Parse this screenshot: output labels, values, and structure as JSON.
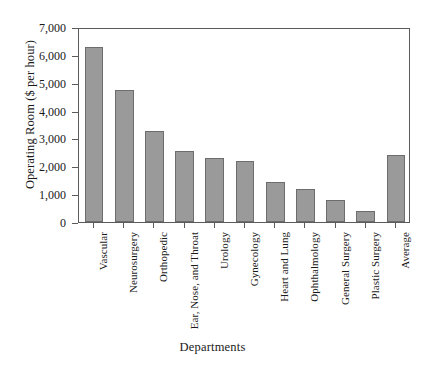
{
  "chart_data": {
    "type": "bar",
    "title": "",
    "xlabel": "Departments",
    "ylabel": "Operating Room ($ per hour)",
    "categories": [
      "Vascular",
      "Neurosurgery",
      "Orthopedic",
      "Ear, Nose, and Throat",
      "Urology",
      "Gynecology",
      "Heart and Lung",
      "Ophthalmology",
      "General Surgery",
      "Plastic Surgery",
      "Average"
    ],
    "values": [
      6300,
      4750,
      3250,
      2550,
      2300,
      2200,
      1450,
      1200,
      800,
      400,
      2400
    ],
    "ylim": [
      0,
      7000
    ],
    "ytick_values": [
      0,
      1000,
      2000,
      3000,
      4000,
      5000,
      6000,
      7000
    ],
    "ytick_labels": [
      "0",
      "1,000",
      "2,000",
      "3,000",
      "4,000",
      "5,000",
      "6,000",
      "7,000"
    ],
    "grid": false,
    "legend": null,
    "bar_color": "#9a9a9a",
    "bar_edge_color": "#6d6d6d",
    "axis_color": "#5b5b5b",
    "background_color": "#ffffff"
  }
}
